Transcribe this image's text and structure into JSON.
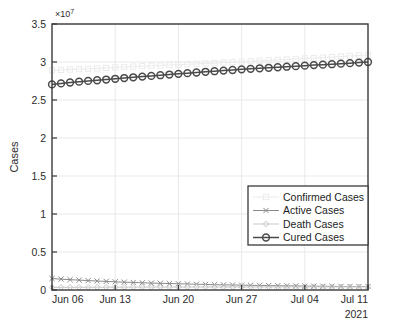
{
  "figure": {
    "background_color": "#ffffff",
    "axis_color": "#3a3a3a",
    "grid_color": "#e3e3e3"
  },
  "chart_data": {
    "type": "line",
    "title": "",
    "xlabel": "",
    "ylabel": "Cases",
    "y_exponent_label": "×10",
    "y_exponent_power": "7",
    "y_exponent_value": 10000000,
    "x_year_label": "2021",
    "grid": true,
    "legend_position": "lower-right",
    "xlim": [
      "Jun 06",
      "Jul 11"
    ],
    "ylim": [
      0,
      35000000
    ],
    "yticks": [
      "0",
      "0.5",
      "1",
      "1.5",
      "2",
      "2.5",
      "3",
      "3.5"
    ],
    "ytick_values": [
      0,
      5000000,
      10000000,
      15000000,
      20000000,
      25000000,
      30000000,
      35000000
    ],
    "xticks": [
      "Jun 06",
      "Jun 13",
      "Jun 20",
      "Jun 27",
      "Jul 04",
      "Jul 11"
    ],
    "xtick_days": [
      0,
      7,
      14,
      21,
      28,
      35
    ],
    "x": [
      0,
      1,
      2,
      3,
      4,
      5,
      6,
      7,
      8,
      9,
      10,
      11,
      12,
      13,
      14,
      15,
      16,
      17,
      18,
      19,
      20,
      21,
      22,
      23,
      24,
      25,
      26,
      27,
      28,
      29,
      30,
      31,
      32,
      33,
      34,
      35
    ],
    "series": [
      {
        "name": "Confirmed Cases",
        "color": "#ebebeb",
        "marker": "square",
        "marker_size": 2.6,
        "line_width": 1.0,
        "values": [
          28900000,
          28960000,
          29010000,
          29060000,
          29110000,
          29160000,
          29220000,
          29280000,
          29340000,
          29400000,
          29450000,
          29500000,
          29550000,
          29600000,
          29650000,
          29700000,
          29750000,
          29800000,
          29860000,
          29920000,
          29980000,
          30040000,
          30100000,
          30160000,
          30220000,
          30280000,
          30340000,
          30400000,
          30460000,
          30520000,
          30580000,
          30650000,
          30720000,
          30790000,
          30860000,
          30930000
        ]
      },
      {
        "name": "Active Cases",
        "color": "#8a8a8a",
        "marker": "x",
        "marker_size": 2.6,
        "line_width": 1.0,
        "values": [
          1510000,
          1430000,
          1360000,
          1300000,
          1240000,
          1180000,
          1130000,
          1080000,
          1030000,
          990000,
          950000,
          910000,
          880000,
          850000,
          820000,
          790000,
          760000,
          730000,
          700000,
          680000,
          660000,
          640000,
          620000,
          600000,
          580000,
          560000,
          545000,
          530000,
          515000,
          500000,
          490000,
          480000,
          470000,
          462000,
          455000,
          450000
        ]
      },
      {
        "name": "Death Cases",
        "color": "#c9c9c9",
        "marker": "diamond",
        "marker_size": 2.8,
        "line_width": 1.0,
        "values": [
          345000,
          349000,
          353000,
          357000,
          361000,
          365000,
          368000,
          371000,
          374000,
          377000,
          380000,
          383000,
          386000,
          388000,
          390000,
          392000,
          394000,
          396000,
          398000,
          399000,
          400000,
          401000,
          402000,
          403000,
          404000,
          405000,
          406000,
          406500,
          407000,
          407500,
          408000,
          408500,
          409000,
          409500,
          410000,
          410500
        ]
      },
      {
        "name": "Cured Cases",
        "color": "#4a4a4a",
        "marker": "circle",
        "marker_size": 3.4,
        "line_width": 1.5,
        "values": [
          27050000,
          27180000,
          27300000,
          27410000,
          27510000,
          27600000,
          27690000,
          27790000,
          27890000,
          27990000,
          28080000,
          28170000,
          28260000,
          28350000,
          28440000,
          28530000,
          28620000,
          28710000,
          28790000,
          28870000,
          28950000,
          29030000,
          29100000,
          29170000,
          29240000,
          29310000,
          29380000,
          29450000,
          29520000,
          29590000,
          29650000,
          29710000,
          29780000,
          29850000,
          29920000,
          30000000
        ]
      }
    ],
    "legend": [
      {
        "label": "Confirmed Cases",
        "marker": "square",
        "color": "#ebebeb"
      },
      {
        "label": "Active Cases",
        "marker": "x",
        "color": "#8a8a8a"
      },
      {
        "label": "Death Cases",
        "marker": "diamond",
        "color": "#c9c9c9"
      },
      {
        "label": "Cured Cases",
        "marker": "circle",
        "color": "#4a4a4a"
      }
    ]
  }
}
